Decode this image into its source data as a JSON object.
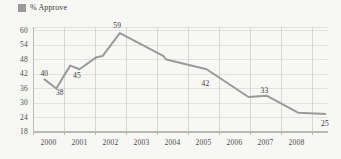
{
  "legend": {
    "swatch_name": "legend-swatch-approve",
    "label": "% Approve",
    "color": "#9a9a9a"
  },
  "chart_data": {
    "type": "line",
    "title": "",
    "subtitle": "",
    "xlabel": "",
    "ylabel": "",
    "legend_position": "top-left",
    "grid": true,
    "line_color": "#9a9a9a",
    "series": [
      {
        "name": "% Approve",
        "color": "#9a9a9a",
        "x": [
          1999.85,
          2000.25,
          2000.7,
          2001.0,
          2001.55,
          2001.75,
          2002.3,
          2003.7,
          2003.8,
          2005.1,
          2006.45,
          2007.05,
          2008.05,
          2008.95
        ],
        "values": [
          40,
          36,
          45.5,
          44,
          49,
          49.5,
          59,
          49.5,
          48,
          44,
          32.5,
          33,
          26,
          25.5
        ]
      }
    ],
    "point_labels": [
      {
        "text": "40",
        "x": 1999.9,
        "y": 42
      },
      {
        "text": "38",
        "x": 2000.4,
        "y": 34
      },
      {
        "text": "45",
        "x": 2000.95,
        "y": 41
      },
      {
        "text": "59",
        "x": 2002.25,
        "y": 62
      },
      {
        "text": "42",
        "x": 2005.1,
        "y": 38
      },
      {
        "text": "33",
        "x": 2007.0,
        "y": 35
      },
      {
        "text": "25",
        "x": 2008.95,
        "y": 21.5
      }
    ],
    "yticks": [
      18,
      24,
      30,
      36,
      42,
      48,
      54,
      60
    ],
    "ylim": [
      18,
      61.5
    ],
    "xticks": [
      "2000",
      "2001",
      "2002",
      "2003",
      "2004",
      "2005",
      "2006",
      "2007",
      "2008"
    ],
    "xlim": [
      1999.5,
      2009.0
    ],
    "grid_color_h": "#e2e2e0",
    "grid_color_v": "#d6d6d4",
    "axis_color": "#b8b8b6"
  }
}
